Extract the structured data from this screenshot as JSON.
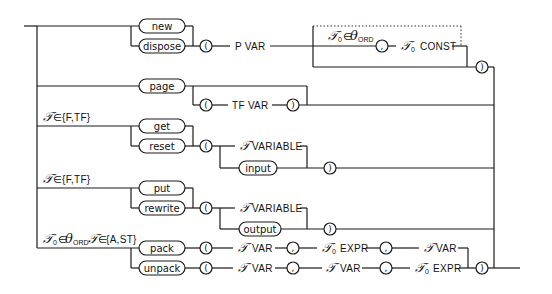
{
  "diagram": {
    "type": "syntax-diagram",
    "branches": [
      {
        "keywords": [
          "new",
          "dispose"
        ],
        "open_paren": "(",
        "param": "P VAR",
        "optional": {
          "condition": "𝒯₀∈θ_ORD",
          "comma": ",",
          "item": "𝒯₀ CONST"
        },
        "close_paren": ")"
      },
      {
        "keywords": [
          "page"
        ],
        "optional_param": {
          "open_paren": "(",
          "param": "TF VAR",
          "close_paren": ")"
        }
      },
      {
        "condition": "𝒯∈{F,TF}",
        "keywords": [
          "get",
          "reset"
        ],
        "open_paren": "(",
        "alternatives": [
          "𝒯 VARIABLE",
          "input"
        ],
        "close_paren": ")"
      },
      {
        "condition": "𝒯∈{F,TF}",
        "keywords": [
          "put",
          "rewrite"
        ],
        "open_paren": "(",
        "alternatives": [
          "𝒯 VARIABLE",
          "output"
        ],
        "close_paren": ")"
      },
      {
        "condition": "𝒯₀∈θ_ORD 𝒯∈{A,ST}",
        "sequences": [
          {
            "keyword": "pack",
            "items": [
              "𝒯 VAR",
              ",",
              "𝒯₀ EXPR",
              ",",
              "𝒯 VAR"
            ]
          },
          {
            "keyword": "unpack",
            "items": [
              "𝒯 VAR",
              ",",
              "𝒯 VAR",
              ",",
              "𝒯₀ EXPR"
            ]
          }
        ],
        "close_paren": ")"
      }
    ]
  },
  "labels": {
    "new": "new",
    "dispose": "dispose",
    "page": "page",
    "get": "get",
    "reset": "reset",
    "put": "put",
    "rewrite": "rewrite",
    "pack": "pack",
    "unpack": "unpack",
    "input": "input",
    "output": "output",
    "lparen": "(",
    "rparen": ")",
    "comma": ",",
    "p_var": "P  VAR",
    "tf_var": "TF  VAR",
    "variable": "VARIABLE",
    "var": "VAR",
    "expr": "EXPR",
    "const": "CONST",
    "tau": "𝒯",
    "tau0": "𝒯",
    "sub0": "0",
    "theta": "θ",
    "ord": "ORD",
    "in": "∈",
    "set_f_tf": "{F,TF}",
    "set_a_st": "{A,ST}"
  }
}
